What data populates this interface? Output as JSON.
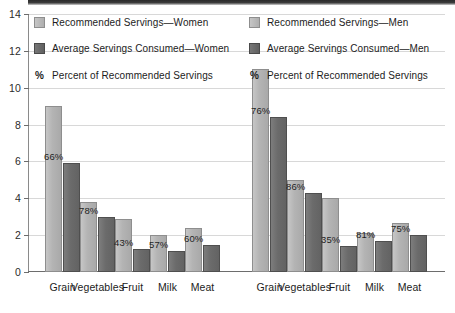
{
  "chart_data": {
    "type": "bar",
    "title": "",
    "subtitle": "",
    "xlabel": "",
    "ylabel": "",
    "ylim": [
      0,
      14
    ],
    "ytick_labels": [
      "0",
      "2",
      "4",
      "6",
      "8",
      "10",
      "12",
      "14"
    ],
    "ytick_values": [
      0,
      2,
      4,
      6,
      8,
      10,
      12,
      14
    ],
    "grid": true,
    "legend_position": "top-inside-two-columns",
    "groups": [
      "Women",
      "Men"
    ],
    "categories": [
      "Grain",
      "Vegetables",
      "Fruit",
      "Milk",
      "Meat"
    ],
    "series": [
      {
        "name": "Recommended Servings—Women",
        "group": "Women",
        "style": "light",
        "values": [
          9.0,
          3.8,
          2.9,
          2.0,
          2.4
        ]
      },
      {
        "name": "Average Servings Consumed—Women",
        "group": "Women",
        "style": "dark",
        "values": [
          5.9,
          3.0,
          1.25,
          1.15,
          1.45
        ]
      },
      {
        "name": "Recommended Servings—Men",
        "group": "Men",
        "style": "light",
        "values": [
          11.0,
          5.0,
          4.0,
          2.1,
          2.65
        ]
      },
      {
        "name": "Average Servings Consumed—Men",
        "group": "Men",
        "style": "dark",
        "values": [
          8.4,
          4.3,
          1.4,
          1.7,
          2.0
        ]
      }
    ],
    "percent_labels": {
      "Women": [
        "66%",
        "78%",
        "43%",
        "57%",
        "60%"
      ],
      "Men": [
        "76%",
        "86%",
        "35%",
        "81%",
        "75%"
      ]
    },
    "colors": {
      "light_bar": "#b4b4b4",
      "light_bar_border": "#8e8e8e",
      "dark_bar": "#6b6b6b",
      "dark_bar_border": "#4f4f4f",
      "gridline": "#d8d8d8",
      "axis": "#6d6d6d",
      "text": "#1c1c1c",
      "background": "#ffffff"
    }
  },
  "legend": {
    "left": [
      {
        "label": "Recommended Servings—Women",
        "swatch": "light"
      },
      {
        "label": "Average Servings Consumed—Women",
        "swatch": "dark"
      },
      {
        "label": "Percent of Recommended Servings",
        "swatch": "percent",
        "symbol": "%"
      }
    ],
    "right": [
      {
        "label": "Recommended Servings—Men",
        "swatch": "light"
      },
      {
        "label": "Average Servings Consumed—Men",
        "swatch": "dark"
      },
      {
        "label": "Percent of Recommended Servings",
        "swatch": "percent",
        "symbol": "%"
      }
    ]
  },
  "axis": {
    "y_ticks": [
      "14",
      "12",
      "10",
      "8",
      "6",
      "4",
      "2",
      "0"
    ],
    "x_labels": [
      "Grain",
      "Vegetables",
      "Fruit",
      "Milk",
      "Meat",
      "Grain",
      "Vegetables",
      "Fruit",
      "Milk",
      "Meat"
    ]
  }
}
